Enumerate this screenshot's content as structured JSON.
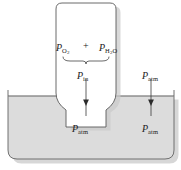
{
  "figure": {
    "colors": {
      "outline": "#4d4d4d",
      "liquid_fill": "#dcdcdc",
      "tube_fill": "#ffffff",
      "arrow": "#3a3a3a",
      "text": "#1a1a1a",
      "shadow": "#bdbdbd"
    },
    "labels": {
      "p_o2": {
        "symbol": "P",
        "sub": "O",
        "sub2": "2",
        "full": "P O2"
      },
      "plus": "+",
      "p_h2o": {
        "symbol": "P",
        "sub_a": "H",
        "sub_a2": "2",
        "sub_b": "O",
        "full": "P H2O"
      },
      "p_in": {
        "symbol": "P",
        "sub": "in",
        "full": "P in"
      },
      "p_atm_inside": {
        "symbol": "P",
        "sub": "atm",
        "full": "P atm"
      },
      "p_atm_outside_top": {
        "symbol": "P",
        "sub": "atm",
        "full": "P atm"
      },
      "p_atm_outside_bottom": {
        "symbol": "P",
        "sub": "atm",
        "full": "P atm"
      }
    },
    "elements": {
      "tube": "inverted-gas-collection-tube",
      "basin": "liquid-basin",
      "liquid": "liquid-surface",
      "brace": "sum-brace",
      "arrow_inside": "downward-pressure-arrow-inside-tube",
      "arrow_outside": "downward-pressure-arrow-outside-tube"
    }
  }
}
